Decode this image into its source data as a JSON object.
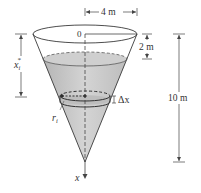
{
  "diagram": {
    "type": "conical-tank-work-problem",
    "labels": {
      "top_radius": "4 m",
      "origin": "0",
      "depth_to_water": "2 m",
      "height": "10 m",
      "slice_position": "x",
      "slice_position_sub": "i",
      "slice_position_sup": "*",
      "slice_radius": "r",
      "slice_radius_sub": "i",
      "slice_thickness": "Δx",
      "axis": "x"
    },
    "colors": {
      "outline": "#3a3a3a",
      "water_fill": "#c9c9c9",
      "water_dark": "#a9a9a9",
      "dimension_line": "#444444",
      "background": "#ffffff"
    }
  }
}
